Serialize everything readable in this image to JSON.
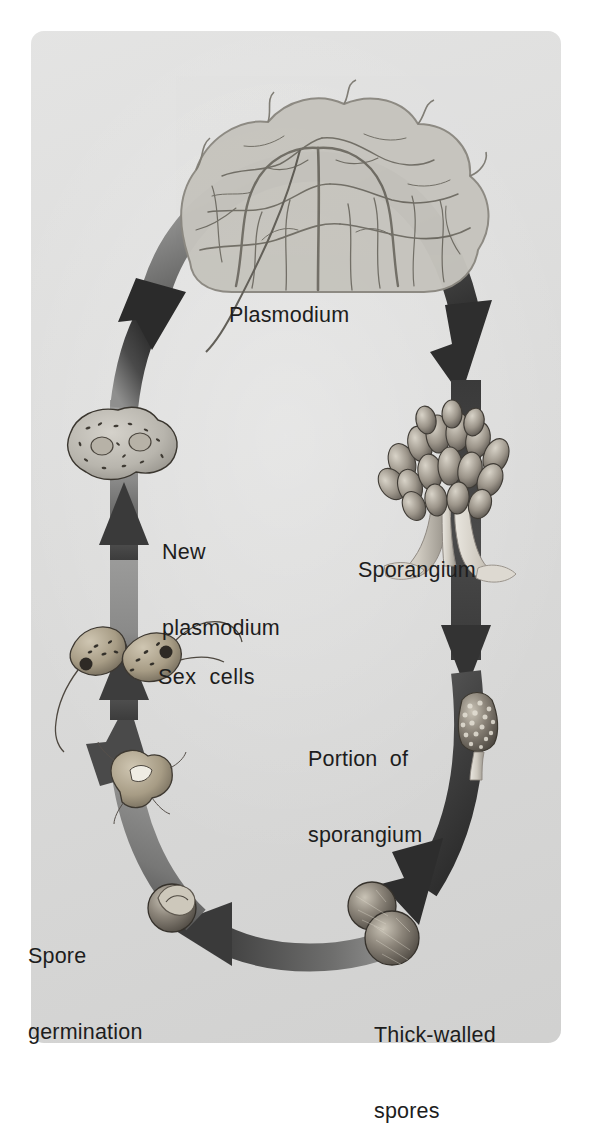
{
  "figure": {
    "plate_background_color": "#dcdcdb",
    "page_background_color": "#ffffff",
    "text_color": "#1d1d1d",
    "arrow_dark_color": "#3a3a3a",
    "arrow_light_color": "#a9a9a8"
  },
  "labels": {
    "plasmodium": "Plasmodium",
    "new_plasmodium_line1": "New",
    "new_plasmodium_line2": "plasmodium",
    "sex_cells": "Sex  cells",
    "spore_germination_line1": "Spore",
    "spore_germination_line2": "germination",
    "sporangium": "Sporangium",
    "portion_line1": "Portion  of",
    "portion_line2": "sporangium",
    "thick_walled_line1": "Thick-walled",
    "thick_walled_line2": "spores"
  },
  "illustrations": [
    {
      "name": "plasmodium-network",
      "caption": "Plasmodium"
    },
    {
      "name": "sporangium-cluster",
      "caption": "Sporangium"
    },
    {
      "name": "portion-of-sporangium",
      "caption": "Portion of sporangium"
    },
    {
      "name": "thick-walled-spores",
      "caption": "Thick-walled spores"
    },
    {
      "name": "germinating-spore",
      "caption": "Spore germination"
    },
    {
      "name": "amoeboid-cell",
      "caption": "Spore germination"
    },
    {
      "name": "sex-cells-fusing",
      "caption": "Sex cells"
    },
    {
      "name": "new-plasmodium-cell",
      "caption": "New plasmodium"
    }
  ],
  "cycle": {
    "direction": "clockwise",
    "arrows": [
      {
        "name": "arrow-plasmodium-to-sporangium",
        "from": "Plasmodium",
        "to": "Sporangium"
      },
      {
        "name": "arrow-sporangium-to-portion",
        "from": "Sporangium",
        "to": "Portion of sporangium"
      },
      {
        "name": "arrow-portion-to-spores",
        "from": "Portion of sporangium",
        "to": "Thick-walled spores"
      },
      {
        "name": "arrow-spores-to-germination",
        "from": "Thick-walled spores",
        "to": "Spore germination"
      },
      {
        "name": "arrow-germination-to-sexcells",
        "from": "Spore germination",
        "to": "Sex cells"
      },
      {
        "name": "arrow-sexcells-to-new",
        "from": "Sex cells",
        "to": "New plasmodium"
      },
      {
        "name": "arrow-new-to-plasmodium",
        "from": "New plasmodium",
        "to": "Plasmodium"
      }
    ]
  }
}
